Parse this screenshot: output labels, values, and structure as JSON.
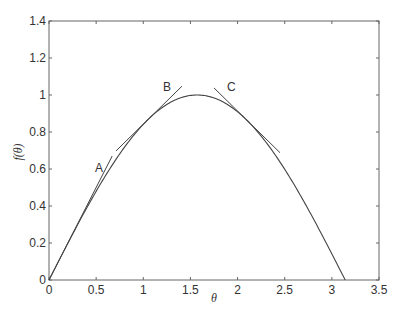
{
  "chart_data": {
    "type": "line",
    "title": "",
    "xlabel": "θ",
    "ylabel": "f(θ)",
    "xlim": [
      0,
      3.5
    ],
    "ylim": [
      0,
      1.4
    ],
    "grid": false,
    "legend": null,
    "xticks": [
      "0",
      "0.5",
      "1",
      "1.5",
      "2",
      "2.5",
      "3",
      "3.5"
    ],
    "yticks": [
      "0",
      "0.2",
      "0.4",
      "0.6",
      "0.8",
      "1",
      "1.2",
      "1.4"
    ],
    "series": [
      {
        "name": "f(θ) = sin(θ)",
        "x": [
          0,
          0.25,
          0.5,
          0.75,
          1.0,
          1.25,
          1.5,
          1.5708,
          1.75,
          2.0,
          2.25,
          2.5,
          2.75,
          3.0,
          3.1416
        ],
        "y": [
          0,
          0.247,
          0.479,
          0.682,
          0.841,
          0.949,
          0.997,
          1.0,
          0.984,
          0.909,
          0.778,
          0.598,
          0.382,
          0.141,
          0
        ]
      }
    ],
    "tangent_lines": [
      {
        "label": "A",
        "at_theta": 0,
        "slope": 1,
        "x_range": [
          0,
          0.67
        ]
      },
      {
        "label": "B",
        "at_theta": 1.047,
        "slope": 0.5,
        "x_range": [
          0.71,
          1.41
        ]
      },
      {
        "label": "C",
        "at_theta": 2.094,
        "slope": -0.5,
        "x_range": [
          1.75,
          2.45
        ]
      }
    ],
    "annotations": [
      {
        "text": "A",
        "x": 0.53,
        "y": 0.68
      },
      {
        "text": "B",
        "x": 1.26,
        "y": 1.03
      },
      {
        "text": "C",
        "x": 1.94,
        "y": 1.03
      }
    ]
  },
  "labels": {
    "xlabel": "θ",
    "ylabel": "f(θ)",
    "annotA": "A",
    "annotB": "B",
    "annotC": "C"
  }
}
